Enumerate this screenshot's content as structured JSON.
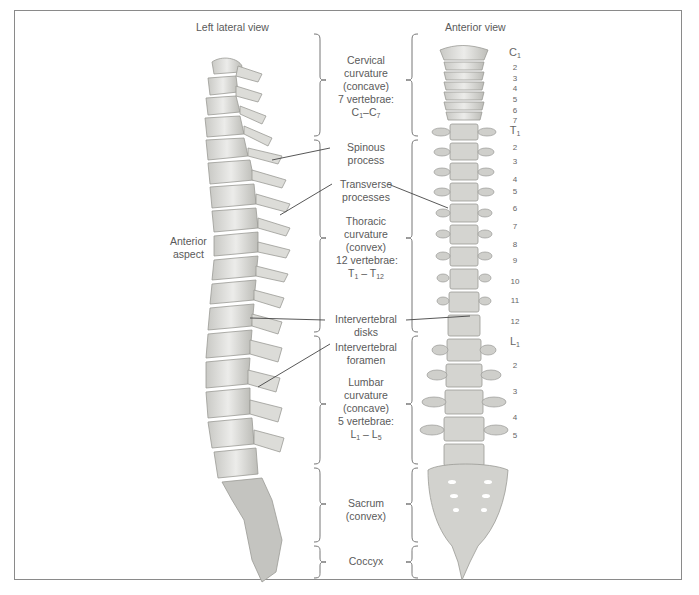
{
  "views": {
    "left": "Left lateral view",
    "right": "Anterior view"
  },
  "anterior_aspect": {
    "line1": "Anterior",
    "line2": "aspect"
  },
  "regions": {
    "cervical": {
      "l1": "Cervical",
      "l2": "curvature",
      "l3": "(concave)",
      "l4": "7 vertebrae:",
      "range_a": "C",
      "range_a_sub": "1",
      "range_sep": "–",
      "range_b": "C",
      "range_b_sub": "7"
    },
    "thoracic": {
      "l1": "Thoracic",
      "l2": "curvature",
      "l3": "(convex)",
      "l4": "12 vertebrae:",
      "range_a": "T",
      "range_a_sub": "1",
      "range_sep": " – ",
      "range_b": "T",
      "range_b_sub": "12"
    },
    "lumbar": {
      "l1": "Lumbar",
      "l2": "curvature",
      "l3": "(concave)",
      "l4": "5 vertebrae:",
      "range_a": "L",
      "range_a_sub": "1",
      "range_sep": " – ",
      "range_b": "L",
      "range_b_sub": "5"
    },
    "sacrum": {
      "l1": "Sacrum",
      "l2": "(convex)"
    },
    "coccyx": {
      "l1": "Coccyx"
    }
  },
  "labels": {
    "spinous": {
      "l1": "Spinous",
      "l2": "process"
    },
    "transverse": {
      "l1": "Transverse",
      "l2": "processes"
    },
    "disks": {
      "l1": "Intervertebral",
      "l2": "disks"
    },
    "foramen": {
      "l1": "Intervertebral",
      "l2": "foramen"
    }
  },
  "levels": {
    "cervical": {
      "first_letter": "C",
      "first_sub": "1",
      "rest": [
        "2",
        "3",
        "4",
        "5",
        "6",
        "7"
      ]
    },
    "thoracic": {
      "first_letter": "T",
      "first_sub": "1",
      "rest": [
        "2",
        "3",
        "4",
        "5",
        "6",
        "7",
        "8",
        "9",
        "10",
        "11",
        "12"
      ]
    },
    "lumbar": {
      "first_letter": "L",
      "first_sub": "1",
      "rest": [
        "2",
        "3",
        "4",
        "5"
      ]
    }
  },
  "colors": {
    "bone": "#d9d9d6",
    "bone_shade": "#a9a9a5",
    "line": "#555555",
    "frame": "#8a8a8a",
    "text": "#5a5a5a"
  }
}
